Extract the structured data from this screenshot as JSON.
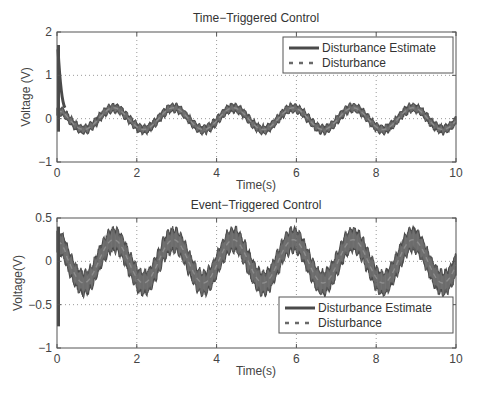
{
  "chart_data": [
    {
      "type": "line",
      "title": "Time−Triggered Control",
      "xlabel": "Time(s)",
      "ylabel": "Voltage (V)",
      "xlim": [
        0,
        10
      ],
      "ylim": [
        -1,
        2
      ],
      "xticks": [
        0,
        2,
        4,
        6,
        8,
        10
      ],
      "yticks": [
        -1,
        0,
        1,
        2
      ],
      "ytick_labels": [
        "−1",
        "0",
        "1",
        "2"
      ],
      "grid": true,
      "legend_position": "upper right",
      "series": [
        {
          "name": "Disturbance Estimate",
          "style": "solid-thick-band",
          "description": "sinusoid, period ~1.5 s, amplitude ~0.25 V, noisy band ~±0.08 V, initial spike to ~1.7 V at t=0",
          "offset": 0.0,
          "amplitude": 0.25,
          "period": 1.5,
          "phase_peak_t": 1.42,
          "band_halfwidth": 0.08,
          "initial_spike": 1.7,
          "initial_min": -0.3
        },
        {
          "name": "Disturbance",
          "style": "dashed",
          "description": "sinusoid, period ~1.5 s, amplitude ~0.25 V",
          "offset": 0.0,
          "amplitude": 0.25,
          "period": 1.5,
          "phase_peak_t": 1.42
        }
      ],
      "sample_points": {
        "x": [
          0,
          0.7,
          1.42,
          2.17,
          2.92,
          3.67,
          4.42,
          5.17,
          5.92,
          6.67,
          7.42,
          8.17,
          8.92,
          9.67,
          10
        ],
        "disturbance_estimate": [
          0.15,
          -0.27,
          0.25,
          -0.25,
          0.25,
          -0.25,
          0.25,
          -0.25,
          0.25,
          -0.25,
          0.25,
          -0.25,
          0.25,
          -0.25,
          -0.05
        ]
      }
    },
    {
      "type": "line",
      "title": "Event−Triggered Control",
      "xlabel": "Time(s)",
      "ylabel": "Voltage(V)",
      "xlim": [
        0,
        10
      ],
      "ylim": [
        -1,
        0.5
      ],
      "xticks": [
        0,
        2,
        4,
        6,
        8,
        10
      ],
      "yticks": [
        -1,
        -0.5,
        0,
        0.5
      ],
      "ytick_labels": [
        "−1",
        "−0.5",
        "0",
        "0.5"
      ],
      "grid": true,
      "legend_position": "lower right",
      "series": [
        {
          "name": "Disturbance Estimate",
          "style": "solid-thick-band",
          "description": "sinusoid, period ~1.5 s, amplitude ~0.25 V, wide noisy band ~±0.12 V, initial dip to ~-0.75 V at t=0",
          "offset": 0.0,
          "amplitude": 0.25,
          "period": 1.5,
          "phase_peak_t": 1.42,
          "band_halfwidth": 0.12,
          "initial_spike": 0.4,
          "initial_min": -0.75
        },
        {
          "name": "Disturbance",
          "style": "dashed",
          "description": "sinusoid, period ~1.5 s, amplitude ~0.25 V",
          "offset": 0.0,
          "amplitude": 0.25,
          "period": 1.5,
          "phase_peak_t": 1.42
        }
      ],
      "sample_points": {
        "x": [
          0,
          0.7,
          1.42,
          2.17,
          2.92,
          3.67,
          4.42,
          5.17,
          5.92,
          6.67,
          7.42,
          8.17,
          8.92,
          9.67,
          10
        ],
        "disturbance_estimate": [
          0.2,
          -0.27,
          0.25,
          -0.25,
          0.25,
          -0.25,
          0.25,
          -0.25,
          0.25,
          -0.25,
          0.25,
          -0.25,
          0.25,
          -0.25,
          -0.05
        ]
      }
    }
  ],
  "layout": {
    "panels": [
      {
        "left": 57,
        "top": 32,
        "right": 456,
        "bottom": 162,
        "legend": {
          "x": 283,
          "y": 37,
          "w": 170,
          "h": 36
        }
      },
      {
        "left": 57,
        "top": 218,
        "right": 456,
        "bottom": 348,
        "legend": {
          "x": 279,
          "y": 297,
          "w": 174,
          "h": 36
        }
      }
    ],
    "colors": {
      "axes": "#555555",
      "grid": "#9a9a9a",
      "band": "#4a4a4a",
      "band_light": "#8a8a8a",
      "text": "#333333"
    }
  }
}
